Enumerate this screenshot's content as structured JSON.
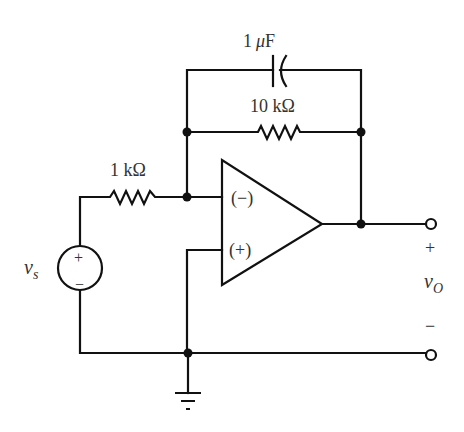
{
  "diagram": {
    "components": {
      "capacitor": {
        "label": "1 μF",
        "value": "1",
        "unit_prefix": "μ",
        "unit": "F"
      },
      "feedback_resistor": {
        "label": "10 kΩ",
        "value": "10 kΩ"
      },
      "input_resistor": {
        "label": "1 kΩ",
        "value": "1 kΩ"
      },
      "opamp": {
        "inverting_label": "(−)",
        "noninverting_label": "(+)"
      },
      "source": {
        "name": "v",
        "subscript": "s",
        "plus": "+",
        "minus": "−"
      },
      "output": {
        "name": "v",
        "subscript": "O",
        "plus": "+",
        "minus": "−"
      }
    },
    "colors": {
      "line": "#111111",
      "text": "#333333",
      "background": "#ffffff"
    }
  }
}
